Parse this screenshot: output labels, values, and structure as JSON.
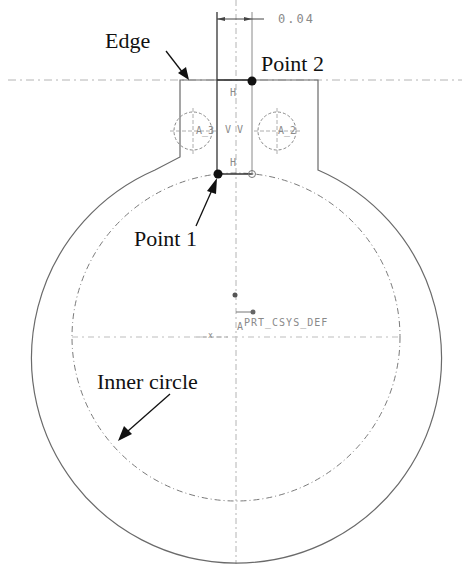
{
  "callouts": {
    "edge": "Edge",
    "point2": "Point 2",
    "point1": "Point 1",
    "inner_circle": "Inner circle"
  },
  "cad_labels": {
    "dimension_value": "0.04",
    "constraint_h_top": "H",
    "constraint_h_bottom": "H",
    "constraint_vv": "V V",
    "axis_a3": "A_3",
    "axis_a2": "A_2",
    "csys": "PRT_CSYS_DEF",
    "csys_x": "x",
    "csys_a": "A",
    "csys_1": "1"
  },
  "colors": {
    "ink": "#111111",
    "cad_line": "#6e6e6e",
    "centerline": "#a8a8a8",
    "background": "#ffffff"
  }
}
